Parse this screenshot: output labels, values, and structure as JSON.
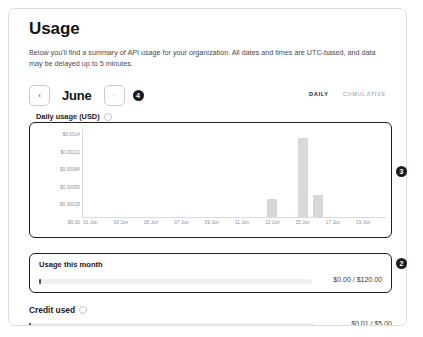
{
  "page": {
    "title": "Usage",
    "description": "Below you'll find a summary of API usage for your organization. All dates and times are UTC-based, and data may be delayed up to 5 minutes."
  },
  "month_nav": {
    "prev_icon": "chevron-left-icon",
    "prev_glyph": "‹",
    "next_icon": "chevron-right-icon",
    "next_glyph": "›",
    "current_month": "June",
    "annotation_badge": "4"
  },
  "mode_toggle": {
    "options": [
      {
        "label": "DAILY",
        "active": true
      },
      {
        "label": "CUMULATIVE",
        "active": false
      }
    ]
  },
  "chart_section": {
    "heading": "Daily usage (USD)",
    "info_icon": "info-icon",
    "annotation_badge": "3"
  },
  "chart_data": {
    "type": "bar",
    "title": "Daily usage (USD)",
    "xlabel": "",
    "ylabel": "",
    "grid": false,
    "legend": null,
    "ylim": [
      0,
      0.0014
    ],
    "ytick_labels": [
      "$0.0014",
      "$0.00112",
      "$0.00084",
      "$0.00056",
      "$0.00028",
      "$0.00"
    ],
    "ytick_values": [
      0.0014,
      0.00112,
      0.00084,
      0.00056,
      0.00028,
      0
    ],
    "xtick_labels": [
      "01 Jun",
      "03 Jun",
      "05 Jun",
      "07 Jun",
      "09 Jun",
      "11 Jun",
      "13 Jun",
      "15 Jun",
      "17 Jun",
      "19 Jun"
    ],
    "categories": [
      "01 Jun",
      "02 Jun",
      "03 Jun",
      "04 Jun",
      "05 Jun",
      "06 Jun",
      "07 Jun",
      "08 Jun",
      "09 Jun",
      "10 Jun",
      "11 Jun",
      "12 Jun",
      "13 Jun",
      "14 Jun",
      "15 Jun",
      "16 Jun",
      "17 Jun",
      "18 Jun",
      "19 Jun",
      "20 Jun"
    ],
    "values": [
      0,
      0,
      0,
      0,
      0,
      0,
      0,
      0,
      0,
      0,
      0,
      0,
      0.00028,
      0,
      0.00126,
      0.00035,
      0,
      0,
      0,
      0
    ],
    "bar_color": "#d8d8dc"
  },
  "usage_panel": {
    "title": "Usage this month",
    "meter_value": "$0.00 / $120.00",
    "meter_percent": 0,
    "annotation_badge": "2"
  },
  "credit_panel": {
    "title": "Credit used",
    "info_icon": "info-icon",
    "meter_value": "$0.01 / $5.00",
    "meter_percent": 0.2
  }
}
